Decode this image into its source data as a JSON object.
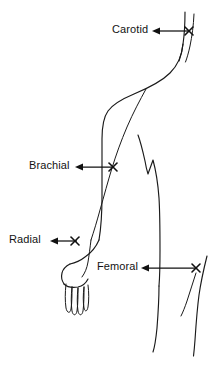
{
  "diagram": {
    "background_color": "#ffffff",
    "line_color": "#1a1a1a",
    "text_color": "#131313",
    "width": 221,
    "height": 365
  },
  "labels": {
    "carotid": "Carotid",
    "brachial": "Brachial",
    "radial": "Radial",
    "femoral": "Femoral"
  },
  "pulse_points": [
    {
      "name": "Carotid",
      "marker": "x-mark",
      "marker_x": 189,
      "marker_y": 31,
      "label_x": 112,
      "label_y": 24,
      "arrow_from_x": 152,
      "arrow_from_y": 31,
      "arrow_to_x": 186,
      "arrow_to_y": 31
    },
    {
      "name": "Brachial",
      "marker": "x-mark",
      "marker_x": 113,
      "marker_y": 167,
      "label_x": 29,
      "label_y": 160,
      "arrow_from_x": 75,
      "arrow_from_y": 167,
      "arrow_to_x": 110,
      "arrow_to_y": 167
    },
    {
      "name": "Radial",
      "marker": "x-mark",
      "marker_x": 75,
      "marker_y": 241,
      "label_x": 9,
      "label_y": 234,
      "arrow_from_x": 50,
      "arrow_from_y": 241,
      "arrow_to_x": 72,
      "arrow_to_y": 241
    },
    {
      "name": "Femoral",
      "marker": "x-mark",
      "marker_x": 196,
      "marker_y": 268,
      "label_x": 97,
      "label_y": 261,
      "arrow_from_x": 141,
      "arrow_from_y": 268,
      "arrow_to_x": 193,
      "arrow_to_y": 268
    }
  ],
  "figure_parts": [
    "neck-line-outer",
    "neck-line-inner",
    "shoulder-and-back-contour",
    "arm-outer-contour",
    "arm-inner-contour",
    "forearm-contour",
    "hand-outline",
    "finger-1",
    "finger-2",
    "finger-3",
    "finger-4",
    "torso-hip-contour",
    "leg-front-contour",
    "leg-back-contour",
    "thigh-crease"
  ]
}
